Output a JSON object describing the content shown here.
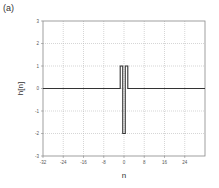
{
  "panel_label": "(a)",
  "chart_data": {
    "type": "line",
    "title": "",
    "xlabel": "n",
    "ylabel": "h[n]",
    "xlim": [
      -32,
      32
    ],
    "ylim": [
      -3,
      3
    ],
    "xticks": [
      -32,
      -24,
      -16,
      -8,
      0,
      8,
      16,
      24
    ],
    "yticks": [
      -3,
      -2,
      -1,
      0,
      1,
      2,
      3
    ],
    "grid": true,
    "series": [
      {
        "name": "h[n]",
        "x": [
          -1,
          0,
          1
        ],
        "values": [
          1,
          -2,
          1
        ],
        "style": "stairs"
      }
    ],
    "colors": {
      "line": "#333333",
      "grid": "#bbbbbb",
      "frame": "#888888"
    }
  }
}
